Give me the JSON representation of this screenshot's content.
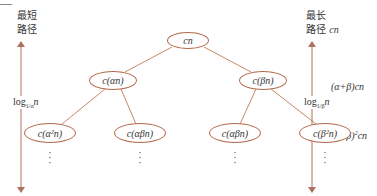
{
  "diagram": {
    "type": "recursion-tree",
    "colors": {
      "edge": "#c9876a",
      "node_border": "#b5694a",
      "arrow": "#b07060",
      "text": "#333333"
    },
    "nodes": [
      {
        "id": "root",
        "label": "cn",
        "level": 0
      },
      {
        "id": "a",
        "label": "c(αn)",
        "level": 1
      },
      {
        "id": "b",
        "label": "c(βn)",
        "level": 1
      },
      {
        "id": "aa",
        "label": "c(α²n)",
        "level": 2
      },
      {
        "id": "ab",
        "label": "c(αβn)",
        "level": 2
      },
      {
        "id": "ba",
        "label": "c(αβn)",
        "level": 2
      },
      {
        "id": "bb",
        "label": "c(β²n)",
        "level": 2
      }
    ],
    "edges": [
      [
        "root",
        "a"
      ],
      [
        "root",
        "b"
      ],
      [
        "a",
        "aa"
      ],
      [
        "a",
        "ab"
      ],
      [
        "b",
        "ba"
      ],
      [
        "b",
        "bb"
      ]
    ],
    "continuation": "⋮",
    "left": {
      "title_line1": "最短",
      "title_line2": "路径",
      "height_label": "log",
      "height_base": "1/α",
      "height_arg": "n"
    },
    "right": {
      "title_line1": "最长",
      "title_line2": "路径",
      "title_cost": "cn",
      "height_label": "log",
      "height_base": "1/β",
      "height_arg": "n",
      "level1_cost": "(α+β)cn",
      "level2_cost_prefix": "(α+β)",
      "level2_cost_exp": "2",
      "level2_cost_suffix": "cn"
    }
  }
}
